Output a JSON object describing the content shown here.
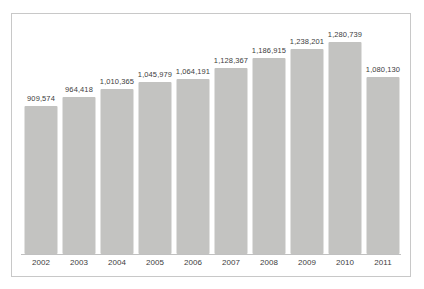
{
  "chart_data": {
    "type": "bar",
    "title": "",
    "subtitle": "",
    "xlabel": "",
    "ylabel": "",
    "grid": false,
    "legend": false,
    "axis_line": true,
    "bar_color": "#c3c3c1",
    "label_color": "#3d3d3d",
    "border_color": "#c8c8c8",
    "categories": [
      "2002",
      "2003",
      "2004",
      "2005",
      "2006",
      "2007",
      "2008",
      "2009",
      "2010",
      "2011"
    ],
    "values": [
      909574,
      964418,
      1010365,
      1045979,
      1064191,
      1128367,
      1186915,
      1238201,
      1280739,
      1080130
    ],
    "value_labels": [
      "909,574",
      "964,418",
      "1,010,365",
      "1,045,979",
      "1,064,191",
      "1,128,367",
      "1,186,915",
      "1,238,201",
      "1,280,739",
      "1,080,130"
    ],
    "ylim": [
      0,
      1400000
    ]
  }
}
